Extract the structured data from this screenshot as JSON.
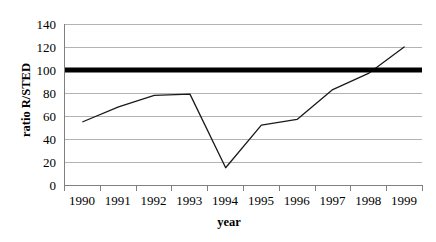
{
  "chart_data": {
    "type": "line",
    "title": "",
    "xlabel": "year",
    "ylabel": "ratio R/STED",
    "categories": [
      "1990",
      "1991",
      "1992",
      "1993",
      "1994",
      "1995",
      "1996",
      "1997",
      "1998",
      "1999"
    ],
    "values": [
      55,
      68,
      78,
      79,
      15,
      52,
      57,
      83,
      97,
      120
    ],
    "series": [
      {
        "name": "ratio R/STED",
        "values": [
          55,
          68,
          78,
          79,
          15,
          52,
          57,
          83,
          97,
          120
        ]
      }
    ],
    "ylim": [
      0,
      140
    ],
    "yticks": [
      0,
      20,
      40,
      60,
      80,
      100,
      120,
      140
    ],
    "ytick_labels": [
      "0",
      "20",
      "40",
      "60",
      "80",
      "100",
      "120",
      "140"
    ],
    "grid": true,
    "legend": false,
    "legend_position": "none",
    "annotations": [
      {
        "type": "reference-line",
        "axis": "y",
        "value": 100,
        "style": "thick-solid-black",
        "label": ""
      }
    ],
    "colors": {
      "line": "#1a1a1a",
      "reference_line": "#000000",
      "gridline": "#b3b3b3",
      "axis": "#808080",
      "background": "#ffffff",
      "text": "#000000"
    }
  }
}
